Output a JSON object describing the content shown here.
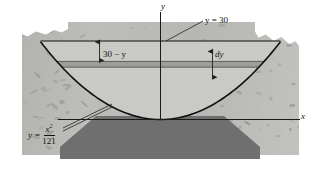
{
  "figure": {
    "axes": {
      "y_label": "y",
      "x_label": "x"
    },
    "labels": {
      "surface_level": "y = 30",
      "depth": "30 − y",
      "slab_thickness": "dy"
    },
    "equation": {
      "lhs": "y =",
      "numerator": "x",
      "numerator_exponent": "2",
      "denominator": "121"
    },
    "colors": {
      "rock": "#b8b8b4",
      "liquid": "#c9c9c5",
      "slab": "#9d9d99",
      "sediment": "#6f6f6f",
      "curve": "#111111",
      "background": "#ffffff"
    }
  },
  "chart_data": {
    "type": "line",
    "xlabel": "x",
    "ylabel": "y",
    "xlim": [
      -60,
      60
    ],
    "ylim": [
      0,
      36
    ],
    "grid": false,
    "legend": "none",
    "curve": {
      "name": "y = x^2/121",
      "equation": "y = x^2/121",
      "a_denominator": 121,
      "x": [
        -60,
        -50,
        -40,
        -30,
        -20,
        -10,
        0,
        10,
        20,
        30,
        40,
        50,
        60
      ],
      "y": [
        29.75,
        20.66,
        13.22,
        7.44,
        3.31,
        0.83,
        0,
        0.83,
        3.31,
        7.44,
        13.22,
        20.66,
        29.75
      ]
    },
    "annotations": [
      {
        "text": "y = 30",
        "type": "surface-level-line",
        "y": 30,
        "x_range": [
          -60,
          60
        ]
      },
      {
        "text": "30 − y",
        "type": "depth-from-surface",
        "x": -33
      },
      {
        "text": "dy",
        "type": "slab-thickness",
        "x": 22
      },
      {
        "text": "y = x^2/121",
        "type": "curve-equation",
        "x": -55,
        "y": 6
      }
    ],
    "slab": {
      "y_bottom": 20.0,
      "y_top": 22.2,
      "thickness": 2.2
    }
  }
}
